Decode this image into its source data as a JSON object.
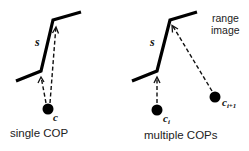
{
  "left_panel": {
    "caption": "single COP",
    "surface_label": "s",
    "cop_label": "c",
    "surface_points": [
      [
        16,
        81
      ],
      [
        41,
        71
      ],
      [
        53,
        20
      ],
      [
        81,
        12
      ]
    ],
    "cop": {
      "x": 48,
      "y": 109,
      "r": 5.5
    },
    "rays": [
      {
        "from": [
          46,
          103
        ],
        "to": [
          41,
          77
        ]
      },
      {
        "from": [
          50,
          103
        ],
        "to": [
          56,
          27
        ]
      }
    ]
  },
  "right_panel": {
    "caption": "multiple COPs",
    "surface_label": "s",
    "corner_label": "range image",
    "corner_label_lines": [
      "range",
      "image"
    ],
    "cop_labels": [
      "c",
      "i",
      "c",
      "i+1"
    ],
    "cop_i_label": "c",
    "cop_i_sub": "i",
    "cop_i1_label": "c",
    "cop_i1_sub": "i+1",
    "surface_points": [
      [
        132,
        81
      ],
      [
        157,
        71
      ],
      [
        170,
        20
      ],
      [
        197,
        12
      ]
    ],
    "cops": [
      {
        "name": "c_i",
        "x": 157,
        "y": 110,
        "r": 5.5
      },
      {
        "name": "c_i+1",
        "x": 215,
        "y": 97,
        "r": 5.5
      }
    ],
    "rays": [
      {
        "from": [
          157,
          103
        ],
        "to": [
          157,
          77
        ]
      },
      {
        "from": [
          212,
          91
        ],
        "to": [
          172,
          25
        ]
      }
    ]
  },
  "colors": {
    "background": "#ffffff",
    "stroke": "#000000",
    "text": "#222222"
  }
}
